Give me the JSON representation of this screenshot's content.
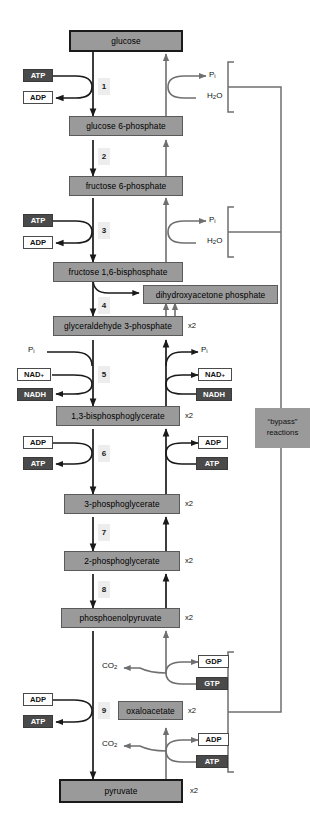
{
  "diagram": {
    "colors": {
      "metabolite_box": "#9a9a9a",
      "chip_dark": "#4a4a4a",
      "chip_light": "#ffffff",
      "step_chip": "#ededed",
      "arrow_dark": "#1a1a1a",
      "arrow_gray": "#6f6f6f",
      "bypass_box": "#9a9a9a"
    }
  },
  "metabolites": [
    {
      "id": "glucose",
      "label": "glucose",
      "multiplier": ""
    },
    {
      "id": "g6p",
      "label": "glucose 6-phosphate",
      "multiplier": ""
    },
    {
      "id": "f6p",
      "label": "fructose 6-phosphate",
      "multiplier": ""
    },
    {
      "id": "fbp",
      "label": "fructose 1,6-bisphosphate",
      "multiplier": ""
    },
    {
      "id": "dhap",
      "label": "dihydroxyacetone phosphate",
      "multiplier": ""
    },
    {
      "id": "g3p",
      "label": "glyceraldehyde 3-phosphate",
      "multiplier": "x2"
    },
    {
      "id": "bpg",
      "label": "1,3-bisphosphoglycerate",
      "multiplier": "x2"
    },
    {
      "id": "pg3",
      "label": "3-phosphoglycerate",
      "multiplier": "x2"
    },
    {
      "id": "pg2",
      "label": "2-phosphoglycerate",
      "multiplier": "x2"
    },
    {
      "id": "pep",
      "label": "phosphoenolpyruvate",
      "multiplier": "x2"
    },
    {
      "id": "oxaloacetate",
      "label": "oxaloacetate",
      "multiplier": "x2"
    },
    {
      "id": "pyruvate",
      "label": "pyruvate",
      "multiplier": "x2"
    }
  ],
  "steps": [
    {
      "id": "step1",
      "number": "1"
    },
    {
      "id": "step2",
      "number": "2"
    },
    {
      "id": "step3",
      "number": "3"
    },
    {
      "id": "step4",
      "number": "4"
    },
    {
      "id": "step5",
      "number": "5"
    },
    {
      "id": "step6",
      "number": "6"
    },
    {
      "id": "step7",
      "number": "7"
    },
    {
      "id": "step8",
      "number": "8"
    },
    {
      "id": "step9",
      "number": "9"
    }
  ],
  "cofactors": {
    "step1_in": {
      "label": "ATP",
      "style": "dark"
    },
    "step1_out": {
      "label": "ADP",
      "style": "light"
    },
    "step3_in": {
      "label": "ATP",
      "style": "dark"
    },
    "step3_out": {
      "label": "ADP",
      "style": "light"
    },
    "step5_nad_in": {
      "label": "NAD+",
      "style": "light"
    },
    "step5_nadh_out": {
      "label": "NADH",
      "style": "dark"
    },
    "step5_nad_r": {
      "label": "NAD+",
      "style": "light"
    },
    "step5_nadh_r": {
      "label": "NADH",
      "style": "dark"
    },
    "step6_adp_in": {
      "label": "ADP",
      "style": "light"
    },
    "step6_atp_out": {
      "label": "ATP",
      "style": "dark"
    },
    "step6_adp_r": {
      "label": "ADP",
      "style": "light"
    },
    "step6_atp_r": {
      "label": "ATP",
      "style": "dark"
    },
    "gdp_out": {
      "label": "GDP",
      "style": "light"
    },
    "gtp_in": {
      "label": "GTP",
      "style": "dark"
    },
    "adp_out_low": {
      "label": "ADP",
      "style": "light"
    },
    "atp_in_low": {
      "label": "ATP",
      "style": "dark"
    },
    "step9_adp_in": {
      "label": "ADP",
      "style": "light"
    },
    "step9_atp_out": {
      "label": "ATP",
      "style": "dark"
    }
  },
  "small_molecules": {
    "pi_top_right": {
      "html": "P<sub>i</sub>"
    },
    "h2o_top_right": {
      "html": "H<sub>2</sub>O"
    },
    "pi_mid_right": {
      "html": "P<sub>i</sub>"
    },
    "h2o_mid_right": {
      "html": "H<sub>2</sub>O"
    },
    "pi_left_g3p": {
      "html": "P<sub>i</sub>"
    },
    "pi_right_g3p": {
      "html": "P<sub>i</sub>"
    },
    "co2_upper": {
      "html": "CO<sub>2</sub>"
    },
    "co2_lower": {
      "html": "CO<sub>2</sub>"
    }
  },
  "annotations": {
    "bypass_line1": "“bypass”",
    "bypass_line2": "reactions"
  }
}
